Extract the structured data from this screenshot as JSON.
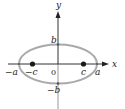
{
  "figure": {
    "type": "ellipse-foci-diagram",
    "colors": {
      "ellipse": "#a9a9a9",
      "axis": "#333333",
      "axis_below": "#999999",
      "focus": "#1a1a1a",
      "label": "#222222"
    },
    "axes": {
      "x_label": "x",
      "y_label": "y",
      "origin_label": "0"
    },
    "points": {
      "vertex_left": "−a",
      "vertex_right": "a",
      "co_vertex_top": "b",
      "co_vertex_bottom": "−b",
      "focus_left": "−c",
      "focus_right": "c"
    }
  }
}
